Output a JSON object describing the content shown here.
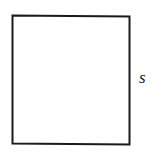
{
  "diagram": {
    "shape": "square",
    "side_label": "s",
    "stroke_color": "#1a1a1a",
    "background": "#ffffff"
  }
}
